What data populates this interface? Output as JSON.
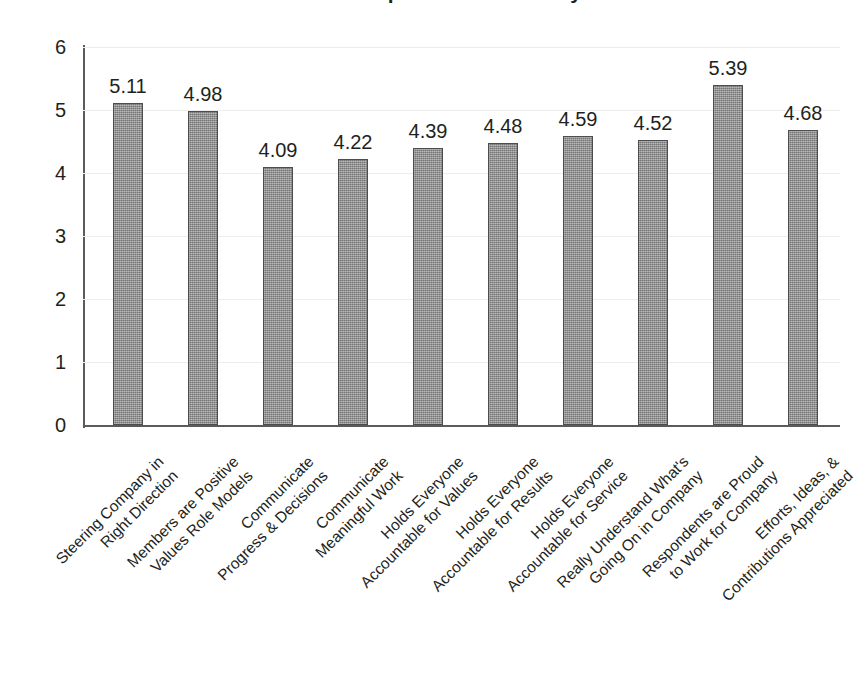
{
  "title_sliver": "Leadership & Culture Survey",
  "chart_data": {
    "type": "bar",
    "title": "",
    "xlabel": "",
    "ylabel": "",
    "ylim": [
      0,
      6
    ],
    "yticks": [
      "0",
      "1",
      "2",
      "3",
      "4",
      "5",
      "6"
    ],
    "grid": true,
    "legend": "none",
    "bar_color": "#8f8f8f",
    "bar_edge_color": "#4d4d4d",
    "categories": [
      "Steering Company in Right Direction",
      "Members are Positive Values Role Models",
      "Communicate Progress & Decisions",
      "Communicate Meaningful Work",
      "Holds Everyone Accountable for Values",
      "Holds Everyone Accountable for Results",
      "Holds Everyone Accountable for Service",
      "Really Understand What's Going On in Company",
      "Respondents are Proud to Work for Company",
      "Efforts, Ideas, & Contributions Appreciated"
    ],
    "category_lines": [
      [
        "Steering Company in",
        "Right Direction"
      ],
      [
        "Members are Positive",
        "Values Role Models"
      ],
      [
        "Communicate",
        "Progress & Decisions"
      ],
      [
        "Communicate",
        "Meaningful Work"
      ],
      [
        "Holds Everyone",
        "Accountable for Values"
      ],
      [
        "Holds Everyone",
        "Accountable for Results"
      ],
      [
        "Holds Everyone",
        "Accountable for Service"
      ],
      [
        "Really Understand What's",
        "Going On in Company"
      ],
      [
        "Respondents are Proud",
        "to Work for Company"
      ],
      [
        "Efforts, Ideas, &",
        "Contributions Appreciated"
      ]
    ],
    "values": [
      5.11,
      4.98,
      4.09,
      4.22,
      4.39,
      4.48,
      4.59,
      4.52,
      5.39,
      4.68
    ],
    "value_labels": [
      "5.11",
      "4.98",
      "4.09",
      "4.22",
      "4.39",
      "4.48",
      "4.59",
      "4.52",
      "5.39",
      "4.68"
    ]
  }
}
